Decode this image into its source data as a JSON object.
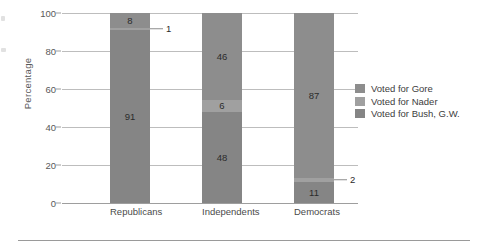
{
  "chart_data": {
    "type": "bar",
    "subtype": "stacked-100-percent",
    "title": "",
    "xlabel": "",
    "ylabel": "Percentage",
    "ylim": [
      0,
      100
    ],
    "yticks": [
      0,
      20,
      40,
      60,
      80,
      100
    ],
    "grid": true,
    "legend_position": "right",
    "orientation": "vertical",
    "categories": [
      "Republicans",
      "Independents",
      "Democrats"
    ],
    "series": [
      {
        "name": "Voted for Gore",
        "color": "#8d8d8d",
        "values": [
          8,
          46,
          87
        ]
      },
      {
        "name": "Voted for Nader",
        "color": "#a0a0a0",
        "values": [
          1,
          6,
          2
        ]
      },
      {
        "name": "Voted for Bush, G.W.",
        "color": "#858585",
        "values": [
          91,
          48,
          11
        ]
      }
    ],
    "data_labels": {
      "Republicans": {
        "Voted for Gore": "8",
        "Voted for Nader": "1",
        "Voted for Bush, G.W.": "91"
      },
      "Independents": {
        "Voted for Gore": "46",
        "Voted for Nader": "6",
        "Voted for Bush, G.W.": "48"
      },
      "Democrats": {
        "Voted for Gore": "87",
        "Voted for Nader": "2",
        "Voted for Bush, G.W.": "11"
      }
    },
    "callouts": [
      {
        "category": "Republicans",
        "series": "Voted for Nader",
        "text": "1"
      },
      {
        "category": "Democrats",
        "series": "Voted for Nader",
        "text": "2"
      }
    ]
  },
  "axis": {
    "y_title": "Percentage",
    "y_ticks": [
      "100",
      "80",
      "60",
      "40",
      "20",
      "0"
    ]
  },
  "categories": {
    "republicans": "Republicans",
    "independents": "Independents",
    "democrats": "Democrats"
  },
  "legend": {
    "items": [
      {
        "label": "Voted for Gore"
      },
      {
        "label": "Voted for Nader"
      },
      {
        "label": "Voted for Bush, G.W."
      }
    ]
  },
  "values": {
    "republicans": {
      "gore": "8",
      "nader": "1",
      "bush": "91"
    },
    "independents": {
      "gore": "46",
      "nader": "6",
      "bush": "48"
    },
    "democrats": {
      "gore": "87",
      "nader": "2",
      "bush": "11"
    }
  },
  "colors": {
    "gore": "#8d8d8d",
    "nader": "#a0a0a0",
    "bush": "#858585",
    "grid": "#bdbdbd",
    "text": "#4a4a4a"
  }
}
